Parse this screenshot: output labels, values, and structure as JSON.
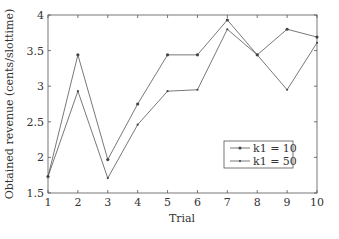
{
  "chart_data": {
    "type": "line",
    "title": "",
    "xlabel": "Trial",
    "ylabel": "Obtained revenue (cents/slottime)",
    "x": [
      1,
      2,
      3,
      4,
      5,
      6,
      7,
      8,
      9,
      10
    ],
    "xlim": [
      1,
      10
    ],
    "ylim": [
      1.5,
      4
    ],
    "xticks": [
      "1",
      "2",
      "3",
      "4",
      "5",
      "6",
      "7",
      "8",
      "9",
      "10"
    ],
    "yticks": [
      "1.5",
      "2",
      "2.5",
      "3",
      "3.5",
      "4"
    ],
    "grid": false,
    "legend_position": "lower right",
    "series": [
      {
        "name": "k1 = 10",
        "marker": "filled-dot",
        "color": "#555555",
        "values": [
          1.73,
          3.44,
          1.97,
          2.75,
          3.44,
          3.44,
          3.93,
          3.44,
          3.8,
          3.69
        ]
      },
      {
        "name": "k1 = 50",
        "marker": "small-dot",
        "color": "#555555",
        "values": [
          1.73,
          2.93,
          1.71,
          2.46,
          2.93,
          2.95,
          3.8,
          3.44,
          2.95,
          3.61
        ]
      }
    ]
  }
}
